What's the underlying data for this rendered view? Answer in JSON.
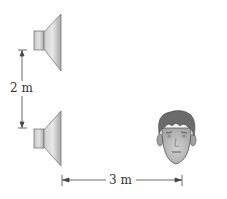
{
  "diagram": {
    "type": "physics-figure",
    "elements": {
      "speaker_top": {
        "name": "loudspeaker",
        "position": "upper-left"
      },
      "speaker_bottom": {
        "name": "loudspeaker",
        "position": "lower-left"
      },
      "listener": {
        "name": "listener-face",
        "position": "lower-right"
      }
    },
    "dimensions": {
      "vertical": {
        "label": "2 m",
        "between": "speaker_top and speaker_bottom"
      },
      "horizontal": {
        "label": "3 m",
        "between": "speaker_bottom and listener"
      }
    },
    "colors": {
      "speaker_light": "#e6e6e6",
      "speaker_dark": "#9a9a9a",
      "outline": "#666666",
      "face_skin": "#b8b8b8",
      "hair": "#6b6b6b",
      "line": "#444444"
    }
  }
}
